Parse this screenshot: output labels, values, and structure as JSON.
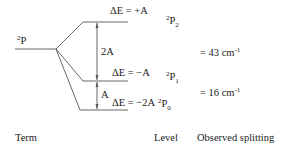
{
  "diagram": {
    "type": "energy-level-splitting",
    "term": {
      "sup": "2",
      "symbol": "P"
    },
    "levels": [
      {
        "id": "top",
        "energy_label": "ΔE = +A",
        "level": {
          "sup": "2",
          "symbol": "P",
          "sub": "2"
        }
      },
      {
        "id": "middle",
        "energy_label": "ΔE = −A",
        "level": {
          "sup": "2",
          "symbol": "P",
          "sub": "1"
        }
      },
      {
        "id": "bottom",
        "energy_label": "ΔE = −2A",
        "level": {
          "sup": "2",
          "symbol": "P",
          "sub": "0"
        }
      }
    ],
    "gaps": [
      {
        "label": "2A",
        "between": [
          "top",
          "middle"
        ]
      },
      {
        "label": "A",
        "between": [
          "middle",
          "bottom"
        ]
      }
    ],
    "splittings": [
      {
        "prefix": "= 43 cm",
        "exp": "-1"
      },
      {
        "prefix": "= 16 cm",
        "exp": "-1"
      }
    ],
    "columns": {
      "term": "Term",
      "level": "Level",
      "observed": "Observed splitting"
    },
    "colors": {
      "line": "#555555",
      "text": "#222222"
    }
  }
}
